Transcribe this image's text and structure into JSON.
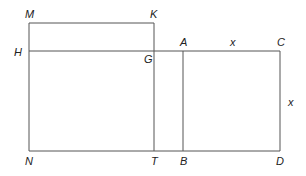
{
  "diagram": {
    "type": "geometric-rectangles",
    "points": {
      "M": [
        29,
        23
      ],
      "K": [
        154,
        23
      ],
      "H": [
        29,
        51
      ],
      "G": [
        154,
        51
      ],
      "A": [
        183,
        51
      ],
      "C": [
        280,
        51
      ],
      "N": [
        29,
        151
      ],
      "T": [
        154,
        151
      ],
      "B": [
        183,
        151
      ],
      "D": [
        280,
        151
      ]
    },
    "labels": [
      {
        "text": "M",
        "x": 25,
        "y": 18
      },
      {
        "text": "K",
        "x": 150,
        "y": 18
      },
      {
        "text": "H",
        "x": 14,
        "y": 56
      },
      {
        "text": "G",
        "x": 144,
        "y": 63
      },
      {
        "text": "A",
        "x": 180,
        "y": 46
      },
      {
        "text": "x",
        "x": 230,
        "y": 46
      },
      {
        "text": "C",
        "x": 277,
        "y": 46
      },
      {
        "text": "x",
        "x": 288,
        "y": 106
      },
      {
        "text": "N",
        "x": 25,
        "y": 165
      },
      {
        "text": "T",
        "x": 151,
        "y": 165
      },
      {
        "text": "B",
        "x": 180,
        "y": 165
      },
      {
        "text": "D",
        "x": 276,
        "y": 165
      }
    ]
  }
}
